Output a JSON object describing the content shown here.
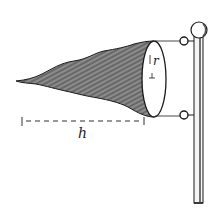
{
  "diagram": {
    "labels": {
      "radius": "r",
      "height": "h"
    },
    "colors": {
      "ink": "#1a1a1a",
      "fill_dark": "#555555",
      "fill_light": "#bdbdbd",
      "background": "#ffffff"
    }
  }
}
